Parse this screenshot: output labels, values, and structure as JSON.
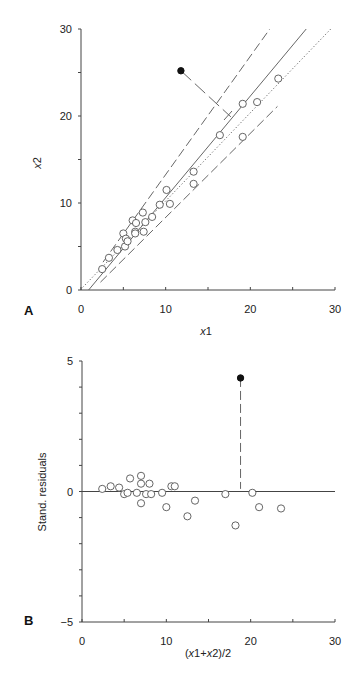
{
  "chart_data": [
    {
      "panel": "A",
      "type": "scatter",
      "title": "",
      "xlabel": "x1",
      "ylabel": "x2",
      "xlim": [
        0,
        30
      ],
      "ylim": [
        0,
        30
      ],
      "xticks": [
        0,
        10,
        20,
        30
      ],
      "yticks": [
        0,
        10,
        20,
        30
      ],
      "minor_tick_step": 5,
      "grid": false,
      "series": [
        {
          "name": "observations",
          "marker": "open-circle",
          "points": [
            [
              2.5,
              2.4
            ],
            [
              3.3,
              3.7
            ],
            [
              4.3,
              4.6
            ],
            [
              5.0,
              6.5
            ],
            [
              5.2,
              5.0
            ],
            [
              5.3,
              5.9
            ],
            [
              5.5,
              5.6
            ],
            [
              6.1,
              8.0
            ],
            [
              6.4,
              6.7
            ],
            [
              6.5,
              7.7
            ],
            [
              6.4,
              6.5
            ],
            [
              7.4,
              6.7
            ],
            [
              7.3,
              8.9
            ],
            [
              7.6,
              7.8
            ],
            [
              8.4,
              8.4
            ],
            [
              9.3,
              9.8
            ],
            [
              10.1,
              11.5
            ],
            [
              10.5,
              9.9
            ],
            [
              13.3,
              13.6
            ],
            [
              13.3,
              12.2
            ],
            [
              16.4,
              17.8
            ],
            [
              19.1,
              21.4
            ],
            [
              19.1,
              17.6
            ],
            [
              20.8,
              21.6
            ],
            [
              23.3,
              24.3
            ]
          ]
        },
        {
          "name": "outlier",
          "marker": "filled-circle",
          "points": [
            [
              11.8,
              25.2
            ]
          ]
        }
      ],
      "lines": [
        {
          "name": "line-of-identity",
          "style": "dotted",
          "from": [
            0.2,
            0.3
          ],
          "to": [
            29.5,
            30.0
          ]
        },
        {
          "name": "regression-fit",
          "style": "solid",
          "from": [
            0.9,
            0.0
          ],
          "to": [
            26.6,
            30.0
          ]
        },
        {
          "name": "upper-limit",
          "style": "dashed",
          "from": [
            2.6,
            3.2
          ],
          "to": [
            22.3,
            30.0
          ]
        },
        {
          "name": "lower-limit",
          "style": "dashed",
          "from": [
            2.3,
            0.9
          ],
          "to": [
            23.2,
            21.1
          ]
        },
        {
          "name": "outlier-connector",
          "style": "long-dash",
          "from": [
            11.8,
            25.2
          ],
          "to": [
            17.7,
            19.9
          ]
        }
      ]
    },
    {
      "panel": "B",
      "type": "scatter",
      "title": "",
      "xlabel": "(x1+x2)/2",
      "ylabel": "Stand. residuals",
      "xlim": [
        0,
        30
      ],
      "ylim": [
        -5,
        5
      ],
      "xticks": [
        0,
        10,
        20,
        30
      ],
      "yticks": [
        -5,
        0,
        5
      ],
      "minor_tick_step_y": 1,
      "minor_tick_step_x": 5,
      "grid": false,
      "zero_line": true,
      "series": [
        {
          "name": "residuals",
          "marker": "open-circle",
          "points": [
            [
              2.4,
              0.1
            ],
            [
              3.4,
              0.2
            ],
            [
              4.4,
              0.15
            ],
            [
              5.0,
              -0.1
            ],
            [
              5.4,
              -0.05
            ],
            [
              5.7,
              0.5
            ],
            [
              6.5,
              -0.05
            ],
            [
              7.0,
              0.6
            ],
            [
              7.0,
              0.3
            ],
            [
              7.0,
              -0.45
            ],
            [
              7.6,
              -0.1
            ],
            [
              8.0,
              0.3
            ],
            [
              8.2,
              -0.1
            ],
            [
              9.5,
              -0.05
            ],
            [
              10.0,
              -0.6
            ],
            [
              10.6,
              0.2
            ],
            [
              11.0,
              0.2
            ],
            [
              12.5,
              -0.95
            ],
            [
              13.4,
              -0.35
            ],
            [
              17.0,
              -0.1
            ],
            [
              18.2,
              -1.3
            ],
            [
              20.2,
              -0.05
            ],
            [
              21.0,
              -0.6
            ],
            [
              23.6,
              -0.65
            ]
          ]
        },
        {
          "name": "outlier",
          "marker": "filled-circle",
          "points": [
            [
              18.8,
              4.35
            ]
          ]
        }
      ],
      "lines": [
        {
          "name": "outlier-drop",
          "style": "dashed",
          "from": [
            18.8,
            4.35
          ],
          "to": [
            18.8,
            0.1
          ]
        }
      ]
    }
  ],
  "labels": {
    "panel_a": "A",
    "panel_b": "B",
    "a_xlabel_x": "x",
    "a_xlabel_sub": "1",
    "a_ylabel_x": "x",
    "a_ylabel_sub": "2",
    "b_ylabel": "Stand. residuals",
    "b_xlabel_pre": "(",
    "b_xlabel_x1": "x",
    "b_xlabel_1": "1+",
    "b_xlabel_x2": "x",
    "b_xlabel_2": "2)/2"
  },
  "colors": {
    "axis": "#444444",
    "line": "#555555",
    "point_open_stroke": "#555555",
    "point_filled": "#111111",
    "text": "#222222"
  }
}
